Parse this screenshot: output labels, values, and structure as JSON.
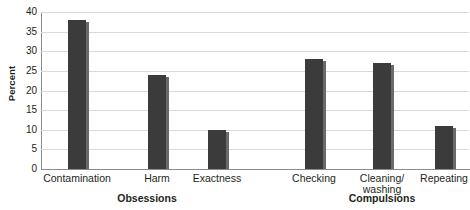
{
  "chart_data": {
    "type": "bar",
    "title": "",
    "xlabel": "",
    "ylabel": "Percent",
    "ylim": [
      0,
      40
    ],
    "ytick_values": [
      0,
      5,
      10,
      15,
      20,
      25,
      30,
      35,
      40
    ],
    "ytick_labels": [
      "0",
      "5",
      "10",
      "15",
      "20",
      "25",
      "30",
      "35",
      "40"
    ],
    "grid": true,
    "legend": "none",
    "bar_color": "#3b3b3b",
    "gridline_color": "#d9d9d9",
    "axis_color": "#8b8b8b",
    "categories": [
      "Contamination",
      "Harm",
      "Exactness",
      "Checking",
      "Cleaning/\nwashing",
      "Repeating"
    ],
    "values": [
      38,
      24,
      10,
      28,
      27,
      11
    ],
    "groups": [
      {
        "label": "Obsessions",
        "categories": [
          "Contamination",
          "Harm",
          "Exactness"
        ]
      },
      {
        "label": "Compulsions",
        "categories": [
          "Checking",
          "Cleaning/washing",
          "Repeating"
        ]
      }
    ]
  },
  "axis": {
    "y_title": "Percent"
  },
  "bars": [
    {
      "label": "Contamination",
      "value": 38,
      "left": 68,
      "width": 18
    },
    {
      "label": "Harm",
      "value": 24,
      "left": 148,
      "width": 18
    },
    {
      "label": "Exactness",
      "value": 10,
      "left": 208,
      "width": 18
    },
    {
      "label": "Checking",
      "value": 28,
      "left": 305,
      "width": 18
    },
    {
      "label": "Cleaning/\nwashing",
      "value": 27,
      "left": 373,
      "width": 18
    },
    {
      "label": "Repeating",
      "value": 11,
      "left": 435,
      "width": 18
    }
  ],
  "group_labels": [
    {
      "text": "Obsessions",
      "center": 147
    },
    {
      "text": "Compulsions",
      "center": 382
    }
  ]
}
